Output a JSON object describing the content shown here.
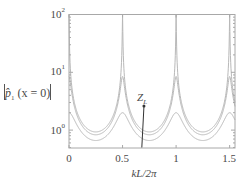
{
  "chart_data": {
    "type": "line",
    "title": "",
    "xlabel": "kL/2π",
    "ylabel": "|p̂₁(x = 0)|",
    "yscale": "log",
    "xlim": [
      0,
      1.55
    ],
    "ylim": [
      0.49,
      100
    ],
    "grid": false,
    "legend": null,
    "x_ticks": [
      "0",
      "0.5",
      "1",
      "1.5"
    ],
    "x_tick_values": [
      0,
      0.5,
      1,
      1.5
    ],
    "y_ticks": [
      "10^0",
      "10^1",
      "10^2"
    ],
    "y_tick_values": [
      1,
      10,
      100
    ],
    "annotations": [
      {
        "text": "Z_L",
        "arrow_from": [
          0.68,
          0.5
        ],
        "arrow_to": [
          0.7,
          2.6
        ],
        "note": "arrow indicating increasing Z_L"
      }
    ],
    "x": [
      0,
      0.05,
      0.1,
      0.15,
      0.2,
      0.25,
      0.3,
      0.35,
      0.4,
      0.45,
      0.5,
      0.55,
      0.6,
      0.65,
      0.7,
      0.75,
      0.8,
      0.85,
      0.9,
      0.95,
      1.0,
      1.05,
      1.1,
      1.15,
      1.2,
      1.25,
      1.3,
      1.35,
      1.4,
      1.45,
      1.5,
      1.55
    ],
    "series": [
      {
        "name": "curve-1 (lowest Z_L)",
        "peak": 100,
        "min": 0.93,
        "values": [
          100,
          3.01,
          1.58,
          1.15,
          0.98,
          0.93,
          0.98,
          1.15,
          1.58,
          3.01,
          100,
          3.01,
          1.58,
          1.15,
          0.98,
          0.93,
          0.98,
          1.15,
          1.58,
          3.01,
          100,
          3.01,
          1.58,
          1.15,
          0.98,
          0.93,
          0.98,
          1.15,
          1.58,
          3.01,
          100,
          3.01
        ]
      },
      {
        "name": "curve-2",
        "peak": 8.5,
        "min": 0.83,
        "values": [
          8.5,
          2.57,
          1.4,
          1.02,
          0.87,
          0.83,
          0.87,
          1.02,
          1.4,
          2.57,
          8.5,
          2.57,
          1.4,
          1.02,
          0.87,
          0.83,
          0.87,
          1.02,
          1.4,
          2.57,
          8.5,
          2.57,
          1.4,
          1.02,
          0.87,
          0.83,
          0.87,
          1.02,
          1.4,
          2.57,
          8.5,
          2.57
        ]
      },
      {
        "name": "curve-3 (highest Z_L)",
        "peak": 2.0,
        "min": 0.66,
        "values": [
          2.0,
          1.5,
          1.02,
          0.79,
          0.69,
          0.66,
          0.69,
          0.79,
          1.02,
          1.5,
          2.0,
          1.5,
          1.02,
          0.79,
          0.69,
          0.66,
          0.69,
          0.79,
          1.02,
          1.5,
          2.0,
          1.5,
          1.02,
          0.79,
          0.69,
          0.66,
          0.69,
          0.79,
          1.02,
          1.5,
          2.0,
          1.5
        ]
      }
    ]
  },
  "labels": {
    "x_ticks": [
      "0",
      "0.5",
      "1",
      "1.5"
    ],
    "y_base": "10",
    "y_exp": [
      "0",
      "1",
      "2"
    ],
    "xlabel": "kL/2π",
    "ylabel_p": "p̂",
    "ylabel_sub": "1",
    "ylabel_arg": "(x = 0)",
    "annot_main": "Z",
    "annot_sub": "L"
  },
  "colors": {
    "curve": "#b8b8b8",
    "frame": "#a8a8a8",
    "arrow": "#333333",
    "text": "#4a4a4a"
  }
}
